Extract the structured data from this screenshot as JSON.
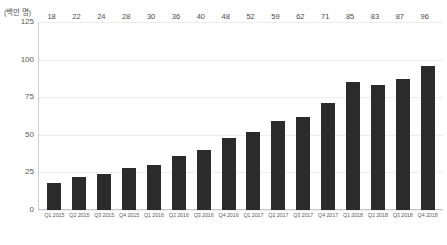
{
  "chart_data": {
    "type": "bar",
    "title": "",
    "subtitle": "",
    "xlabel": "",
    "ylabel": "(백만 명)",
    "ylim": [
      0,
      125
    ],
    "yticks": [
      0,
      25,
      50,
      75,
      100,
      125
    ],
    "ytick_labels": [
      "0",
      "25",
      "50",
      "75",
      "100",
      "125"
    ],
    "grid": true,
    "legend": false,
    "legend_position": "none",
    "bar_color": "#2b2b2b",
    "show_data_labels": true,
    "categories": [
      "Q1 2015",
      "Q2 2015",
      "Q3 2015",
      "Q4 2015",
      "Q1 2016",
      "Q2 2016",
      "Q3 2016",
      "Q4 2016",
      "Q1 2017",
      "Q2 2017",
      "Q3 2017",
      "Q4 2017",
      "Q1 2018",
      "Q2 2018",
      "Q3 2018",
      "Q4 2018"
    ],
    "values": [
      18,
      22,
      24,
      28,
      30,
      36,
      40,
      48,
      52,
      59,
      62,
      71,
      85,
      83,
      87,
      96
    ],
    "value_labels": [
      "18",
      "22",
      "24",
      "28",
      "30",
      "36",
      "40",
      "48",
      "52",
      "59",
      "62",
      "71",
      "85",
      "83",
      "87",
      "96"
    ]
  }
}
